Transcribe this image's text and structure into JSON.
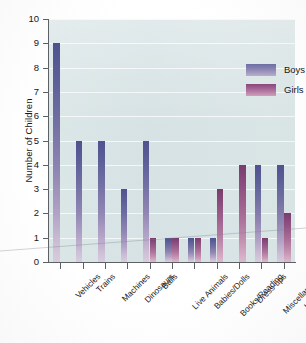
{
  "chart_data": {
    "type": "bar",
    "title": "",
    "xlabel": "",
    "ylabel": "Number of Children",
    "ylim": [
      0,
      10
    ],
    "yticks": [
      0,
      1,
      2,
      3,
      4,
      5,
      6,
      7,
      8,
      9,
      10
    ],
    "grid": true,
    "legend_position": "top-right",
    "categories": [
      "Vehicles",
      "Trains",
      "Machines",
      "Dinosaurs",
      "Balls",
      "Live Animals",
      "Babies/Dolls",
      "Books/Reading",
      "Dress-ups",
      "Miscellaneous",
      "Idiosyncratic"
    ],
    "series": [
      {
        "name": "Boys",
        "color": "#6d6fa4",
        "values": [
          9,
          5,
          5,
          3,
          5,
          1,
          1,
          1,
          0,
          4,
          4
        ]
      },
      {
        "name": "Girls",
        "color": "#87497a",
        "values": [
          0,
          0,
          0,
          0,
          1,
          1,
          1,
          3,
          4,
          1,
          2
        ]
      }
    ]
  },
  "axis": {
    "y_title": "Number of Children",
    "y_tick_labels": [
      "10",
      "9",
      "8",
      "7",
      "6",
      "5",
      "4",
      "3",
      "2",
      "1",
      "0"
    ]
  },
  "legend": {
    "items": [
      {
        "label": "Boys"
      },
      {
        "label": "Girls"
      }
    ]
  },
  "colors": {
    "plot_background": "#dbe6e7",
    "gridline": "#ffffff",
    "axis": "#5c6166",
    "boys": "#6d6fa4",
    "girls": "#87497a",
    "page_background": "#ffffff"
  }
}
